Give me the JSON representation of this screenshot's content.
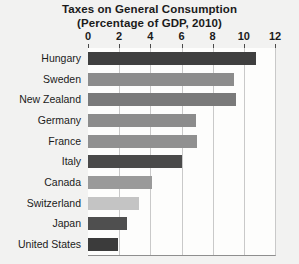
{
  "chart_data": {
    "type": "bar",
    "orientation": "horizontal",
    "title": "Taxes on General Consumption",
    "subtitle": "(Percentage of GDP, 2010)",
    "xlabel": "",
    "ylabel": "",
    "xlim": [
      0,
      12
    ],
    "xticks": [
      0,
      2,
      4,
      6,
      8,
      10,
      12
    ],
    "xtick_labels": [
      "0",
      "2",
      "4",
      "6",
      "8",
      "10",
      "12"
    ],
    "grid": true,
    "grid_axis": "x",
    "legend": false,
    "categories": [
      "Hungary",
      "Sweden",
      "New Zealand",
      "Germany",
      "France",
      "Italy",
      "Canada",
      "Switzerland",
      "Japan",
      "United States"
    ],
    "values": [
      10.8,
      9.4,
      9.5,
      6.9,
      7.0,
      6.0,
      4.1,
      3.3,
      2.5,
      1.9
    ],
    "bar_colors": [
      "#3f3f3f",
      "#8c8c8c",
      "#7a7a7a",
      "#8c8c8c",
      "#909090",
      "#4a4a4a",
      "#9a9a9a",
      "#c4c4c4",
      "#4f4f4f",
      "#3b3b3b"
    ]
  },
  "colors": {
    "page_background": "#f2f2f1",
    "plot_background": "#fdfdfc",
    "gridline": "#c9c9c9",
    "axis": "#8e8e8e",
    "text": "#1b1b1b"
  }
}
